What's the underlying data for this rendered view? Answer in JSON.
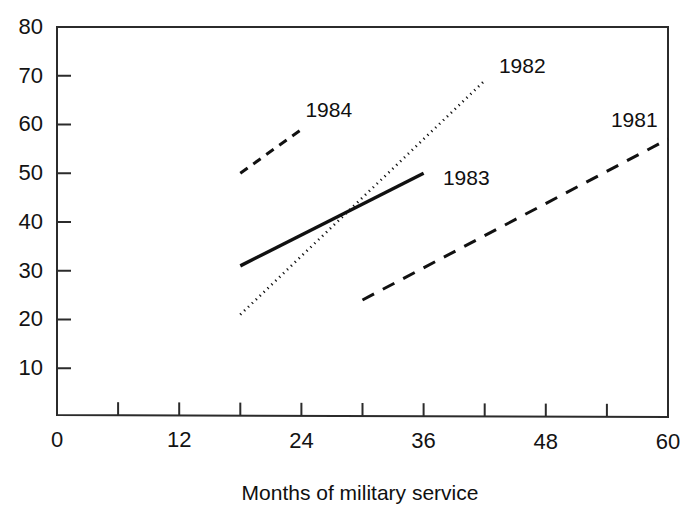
{
  "chart_data": {
    "type": "line",
    "title": "",
    "subtitle": "",
    "xlabel": "Months of military service",
    "ylabel": "",
    "xlim": [
      0,
      60
    ],
    "ylim": [
      0,
      80
    ],
    "x_ticks_major": [
      0,
      12,
      24,
      36,
      48,
      60
    ],
    "x_ticks_minor": [
      6,
      18,
      30,
      42,
      54
    ],
    "y_ticks": [
      10,
      20,
      30,
      40,
      50,
      60,
      70,
      80
    ],
    "x_tick_labels": [
      "0",
      "12",
      "24",
      "36",
      "48",
      "60"
    ],
    "y_tick_labels": [
      "10",
      "20",
      "30",
      "40",
      "50",
      "60",
      "70",
      "80"
    ],
    "grid": false,
    "legend_position": "inline-annotations",
    "series": [
      {
        "name": "1984",
        "label": "1984",
        "style": "dashed",
        "color": "#111111",
        "x": [
          18,
          24
        ],
        "y": [
          50,
          59
        ],
        "label_x": 24,
        "label_y": 63
      },
      {
        "name": "1983",
        "label": "1983",
        "style": "solid",
        "color": "#111111",
        "x": [
          18,
          36
        ],
        "y": [
          31,
          50
        ],
        "label_x": 37.5,
        "label_y": 49
      },
      {
        "name": "1982",
        "label": "1982",
        "style": "dotted",
        "color": "#111111",
        "x": [
          18,
          42
        ],
        "y": [
          21,
          69
        ],
        "label_x": 43,
        "label_y": 72
      },
      {
        "name": "1981",
        "label": "1981",
        "style": "long-dashed",
        "color": "#111111",
        "x": [
          30,
          60
        ],
        "y": [
          24,
          57
        ],
        "label_x": 54,
        "label_y": 61
      }
    ],
    "annotations": [
      {
        "text": "1984",
        "x": 24,
        "y": 63
      },
      {
        "text": "1983",
        "x": 37.5,
        "y": 49
      },
      {
        "text": "1982",
        "x": 43,
        "y": 72
      },
      {
        "text": "1981",
        "x": 54,
        "y": 61
      }
    ]
  },
  "axis": {
    "x_title": "Months of military service"
  },
  "colors": {
    "ink": "#111111",
    "frame": "#2b2b2b",
    "background": "#ffffff"
  }
}
